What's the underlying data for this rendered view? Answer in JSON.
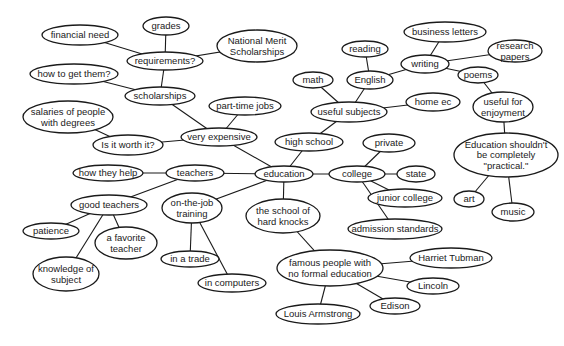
{
  "diagram": {
    "type": "concept map / cluster diagram",
    "center": "education",
    "nodes": [
      {
        "id": "education",
        "label": [
          "education"
        ],
        "x": 284,
        "y": 174,
        "rx": 29,
        "ry": 8
      },
      {
        "id": "very_expensive",
        "label": [
          "very expensive"
        ],
        "x": 219,
        "y": 137,
        "rx": 38,
        "ry": 9
      },
      {
        "id": "part_time_jobs",
        "label": [
          "part-time jobs"
        ],
        "x": 245,
        "y": 106,
        "rx": 36,
        "ry": 9
      },
      {
        "id": "scholarships",
        "label": [
          "scholarships"
        ],
        "x": 160,
        "y": 96,
        "rx": 35,
        "ry": 9
      },
      {
        "id": "requirements",
        "label": [
          "requirements?"
        ],
        "x": 165,
        "y": 61,
        "rx": 38,
        "ry": 9
      },
      {
        "id": "grades",
        "label": [
          "grades"
        ],
        "x": 166,
        "y": 26,
        "rx": 23,
        "ry": 9
      },
      {
        "id": "financial_need",
        "label": [
          "financial need"
        ],
        "x": 80,
        "y": 35,
        "rx": 38,
        "ry": 10
      },
      {
        "id": "national_merit",
        "label": [
          "National Merit",
          "Scholarships"
        ],
        "x": 257,
        "y": 46,
        "rx": 40,
        "ry": 16
      },
      {
        "id": "how_to_get_them",
        "label": [
          "how to get them?"
        ],
        "x": 74,
        "y": 74,
        "rx": 44,
        "ry": 10
      },
      {
        "id": "is_it_worth_it",
        "label": [
          "Is it worth it?"
        ],
        "x": 128,
        "y": 145,
        "rx": 35,
        "ry": 10
      },
      {
        "id": "salaries",
        "label": [
          "salaries of people",
          "with degrees"
        ],
        "x": 68,
        "y": 117,
        "rx": 45,
        "ry": 16
      },
      {
        "id": "teachers",
        "label": [
          "teachers"
        ],
        "x": 195,
        "y": 173,
        "rx": 29,
        "ry": 8
      },
      {
        "id": "how_they_help",
        "label": [
          "how they help"
        ],
        "x": 108,
        "y": 173,
        "rx": 35,
        "ry": 8
      },
      {
        "id": "good_teachers",
        "label": [
          "good teachers"
        ],
        "x": 109,
        "y": 205,
        "rx": 38,
        "ry": 10
      },
      {
        "id": "patience",
        "label": [
          "patience"
        ],
        "x": 51,
        "y": 231,
        "rx": 28,
        "ry": 8
      },
      {
        "id": "a_favorite_teacher",
        "label": [
          "a favorite",
          "teacher"
        ],
        "x": 126,
        "y": 243,
        "rx": 31,
        "ry": 16
      },
      {
        "id": "knowledge_of_subject",
        "label": [
          "knowledge of",
          "subject"
        ],
        "x": 66,
        "y": 274,
        "rx": 33,
        "ry": 17
      },
      {
        "id": "on_the_job_training",
        "label": [
          "on-the-job",
          "training"
        ],
        "x": 192,
        "y": 208,
        "rx": 30,
        "ry": 15
      },
      {
        "id": "in_a_trade",
        "label": [
          "in a trade"
        ],
        "x": 190,
        "y": 259,
        "rx": 29,
        "ry": 8
      },
      {
        "id": "in_computers",
        "label": [
          "in computers"
        ],
        "x": 232,
        "y": 283,
        "rx": 34,
        "ry": 9
      },
      {
        "id": "the_school_of_hard_knocks",
        "label": [
          "the school of",
          "hard knocks"
        ],
        "x": 283,
        "y": 216,
        "rx": 37,
        "ry": 17
      },
      {
        "id": "famous_people",
        "label": [
          "famous people with",
          "no formal education"
        ],
        "x": 330,
        "y": 268,
        "rx": 53,
        "ry": 18
      },
      {
        "id": "harriet_tubman",
        "label": [
          "Harriet Tubman"
        ],
        "x": 451,
        "y": 258,
        "rx": 41,
        "ry": 10
      },
      {
        "id": "lincoln",
        "label": [
          "Lincoln"
        ],
        "x": 433,
        "y": 286,
        "rx": 26,
        "ry": 8
      },
      {
        "id": "edison",
        "label": [
          "Edison"
        ],
        "x": 395,
        "y": 306,
        "rx": 25,
        "ry": 8
      },
      {
        "id": "louis_armstrong",
        "label": [
          "Louis Armstrong"
        ],
        "x": 318,
        "y": 314,
        "rx": 42,
        "ry": 10
      },
      {
        "id": "high_school",
        "label": [
          "high school"
        ],
        "x": 309,
        "y": 142,
        "rx": 34,
        "ry": 9
      },
      {
        "id": "useful_subjects",
        "label": [
          "useful subjects"
        ],
        "x": 349,
        "y": 112,
        "rx": 38,
        "ry": 10
      },
      {
        "id": "math",
        "label": [
          "math"
        ],
        "x": 313,
        "y": 80,
        "rx": 20,
        "ry": 8
      },
      {
        "id": "english",
        "label": [
          "English"
        ],
        "x": 370,
        "y": 80,
        "rx": 23,
        "ry": 9
      },
      {
        "id": "reading",
        "label": [
          "reading"
        ],
        "x": 365,
        "y": 49,
        "rx": 23,
        "ry": 8
      },
      {
        "id": "home_ec",
        "label": [
          "home ec"
        ],
        "x": 433,
        "y": 102,
        "rx": 27,
        "ry": 9
      },
      {
        "id": "writing",
        "label": [
          "writing"
        ],
        "x": 425,
        "y": 64,
        "rx": 24,
        "ry": 9
      },
      {
        "id": "business_letters",
        "label": [
          "business letters"
        ],
        "x": 445,
        "y": 32,
        "rx": 41,
        "ry": 10
      },
      {
        "id": "research_papers",
        "label": [
          "research",
          "papers"
        ],
        "x": 515,
        "y": 51,
        "rx": 27,
        "ry": 11
      },
      {
        "id": "poems",
        "label": [
          "poems"
        ],
        "x": 478,
        "y": 75,
        "rx": 20,
        "ry": 8
      },
      {
        "id": "useful_for_enjoyment",
        "label": [
          "useful for",
          "enjoyment"
        ],
        "x": 503,
        "y": 107,
        "rx": 30,
        "ry": 15
      },
      {
        "id": "education_shouldnt",
        "label": [
          "Education shouldn't",
          "be completely",
          "\"practical.\""
        ],
        "x": 506,
        "y": 155,
        "rx": 52,
        "ry": 22
      },
      {
        "id": "art",
        "label": [
          "art"
        ],
        "x": 469,
        "y": 199,
        "rx": 15,
        "ry": 8
      },
      {
        "id": "music",
        "label": [
          "music"
        ],
        "x": 513,
        "y": 212,
        "rx": 21,
        "ry": 9
      },
      {
        "id": "college",
        "label": [
          "college"
        ],
        "x": 357,
        "y": 174,
        "rx": 28,
        "ry": 8
      },
      {
        "id": "private",
        "label": [
          "private"
        ],
        "x": 389,
        "y": 143,
        "rx": 26,
        "ry": 9
      },
      {
        "id": "state",
        "label": [
          "state"
        ],
        "x": 416,
        "y": 174,
        "rx": 19,
        "ry": 8
      },
      {
        "id": "junior_college",
        "label": [
          "junior college"
        ],
        "x": 405,
        "y": 198,
        "rx": 37,
        "ry": 9
      },
      {
        "id": "admission_standards",
        "label": [
          "admission standards"
        ],
        "x": 395,
        "y": 229,
        "rx": 47,
        "ry": 10
      }
    ],
    "edges": [
      [
        "education",
        "very_expensive"
      ],
      [
        "very_expensive",
        "part_time_jobs"
      ],
      [
        "very_expensive",
        "scholarships"
      ],
      [
        "very_expensive",
        "is_it_worth_it"
      ],
      [
        "is_it_worth_it",
        "salaries"
      ],
      [
        "scholarships",
        "requirements"
      ],
      [
        "scholarships",
        "how_to_get_them"
      ],
      [
        "requirements",
        "grades"
      ],
      [
        "requirements",
        "financial_need"
      ],
      [
        "requirements",
        "national_merit"
      ],
      [
        "education",
        "teachers"
      ],
      [
        "teachers",
        "how_they_help"
      ],
      [
        "teachers",
        "good_teachers"
      ],
      [
        "good_teachers",
        "patience"
      ],
      [
        "good_teachers",
        "a_favorite_teacher"
      ],
      [
        "good_teachers",
        "knowledge_of_subject"
      ],
      [
        "education",
        "on_the_job_training"
      ],
      [
        "on_the_job_training",
        "in_a_trade"
      ],
      [
        "on_the_job_training",
        "in_computers"
      ],
      [
        "education",
        "the_school_of_hard_knocks"
      ],
      [
        "the_school_of_hard_knocks",
        "famous_people"
      ],
      [
        "famous_people",
        "harriet_tubman"
      ],
      [
        "famous_people",
        "lincoln"
      ],
      [
        "famous_people",
        "edison"
      ],
      [
        "famous_people",
        "louis_armstrong"
      ],
      [
        "education",
        "high_school"
      ],
      [
        "high_school",
        "useful_subjects"
      ],
      [
        "useful_subjects",
        "math"
      ],
      [
        "useful_subjects",
        "english"
      ],
      [
        "useful_subjects",
        "home_ec"
      ],
      [
        "english",
        "reading"
      ],
      [
        "english",
        "writing"
      ],
      [
        "writing",
        "business_letters"
      ],
      [
        "writing",
        "research_papers"
      ],
      [
        "writing",
        "poems"
      ],
      [
        "poems",
        "useful_for_enjoyment"
      ],
      [
        "useful_for_enjoyment",
        "education_shouldnt"
      ],
      [
        "education_shouldnt",
        "art"
      ],
      [
        "education_shouldnt",
        "music"
      ],
      [
        "education",
        "college"
      ],
      [
        "college",
        "private"
      ],
      [
        "college",
        "state"
      ],
      [
        "college",
        "junior_college"
      ],
      [
        "college",
        "admission_standards"
      ]
    ]
  },
  "colors": {
    "background": "#ffffff",
    "stroke": "#1a1a1a",
    "text": "#1a1a1a"
  }
}
